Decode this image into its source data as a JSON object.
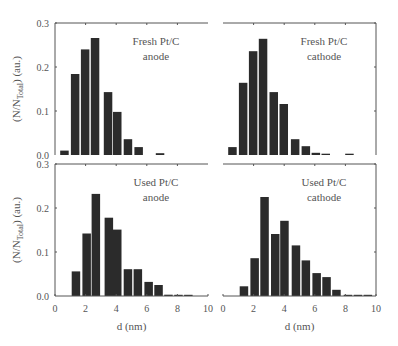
{
  "chart_data": [
    {
      "type": "bar",
      "title": "Fresh Pt/C anode",
      "title_lines": [
        "Fresh Pt/C",
        "anode"
      ],
      "xlabel": "d (nm)",
      "ylabel": "(N/N_Total) (au.)",
      "xlim": [
        0,
        10
      ],
      "ylim": [
        0,
        0.3
      ],
      "xticks": [
        0,
        2,
        4,
        6,
        8,
        10
      ],
      "yticks": [
        0.0,
        0.1,
        0.2,
        0.3
      ],
      "bin_width": 0.62,
      "x": [
        0.65,
        1.35,
        2.0,
        2.65,
        3.5,
        4.1,
        4.8,
        5.5,
        6.9
      ],
      "values": [
        0.01,
        0.184,
        0.24,
        0.266,
        0.143,
        0.098,
        0.036,
        0.018,
        0.004
      ]
    },
    {
      "type": "bar",
      "title": "Fresh Pt/C cathode",
      "title_lines": [
        "Fresh Pt/C",
        "cathode"
      ],
      "xlabel": "d (nm)",
      "ylabel": "(N/N_Total) (au.)",
      "xlim": [
        0,
        10
      ],
      "ylim": [
        0,
        0.3
      ],
      "xticks": [
        0,
        2,
        4,
        6,
        8,
        10
      ],
      "yticks": [
        0.0,
        0.1,
        0.2,
        0.3
      ],
      "bin_width": 0.62,
      "x": [
        0.65,
        1.35,
        2.0,
        2.65,
        3.35,
        4.0,
        4.75,
        5.45,
        6.1,
        6.75,
        8.3
      ],
      "values": [
        0.018,
        0.164,
        0.236,
        0.264,
        0.143,
        0.116,
        0.036,
        0.02,
        0.005,
        0.003,
        0.003
      ]
    },
    {
      "type": "bar",
      "title": "Used Pt/C anode",
      "title_lines": [
        "Used Pt/C",
        "anode"
      ],
      "xlabel": "d (nm)",
      "ylabel": "(N/N_Total) (au.)",
      "xlim": [
        0,
        10
      ],
      "ylim": [
        0,
        0.3
      ],
      "xticks": [
        0,
        2,
        4,
        6,
        8,
        10
      ],
      "yticks": [
        0.0,
        0.1,
        0.2,
        0.3
      ],
      "bin_width": 0.62,
      "x": [
        1.4,
        2.1,
        2.7,
        3.55,
        4.1,
        4.8,
        5.45,
        6.15,
        6.8,
        7.45,
        8.1,
        8.75
      ],
      "values": [
        0.056,
        0.142,
        0.232,
        0.178,
        0.151,
        0.061,
        0.061,
        0.032,
        0.025,
        0.003,
        0.002,
        0.002
      ]
    },
    {
      "type": "bar",
      "title": "Used Pt/C cathode",
      "title_lines": [
        "Used Pt/C",
        "cathode"
      ],
      "xlabel": "d (nm)",
      "ylabel": "(N/N_Total) (au.)",
      "xlim": [
        0,
        10
      ],
      "ylim": [
        0,
        0.3
      ],
      "xticks": [
        0,
        2,
        4,
        6,
        8,
        10
      ],
      "yticks": [
        0.0,
        0.1,
        0.2,
        0.3
      ],
      "bin_width": 0.62,
      "x": [
        1.4,
        2.1,
        2.75,
        3.45,
        4.05,
        4.8,
        5.45,
        6.15,
        6.8,
        7.45,
        8.2,
        8.85,
        9.5
      ],
      "values": [
        0.022,
        0.086,
        0.225,
        0.141,
        0.171,
        0.115,
        0.081,
        0.052,
        0.043,
        0.014,
        0.002,
        0.002,
        0.002
      ]
    }
  ],
  "figure": {
    "ylabel_main": "(N/N",
    "ylabel_sub": "Total",
    "ylabel_tail": ") (au.)",
    "xlabel": "d (nm)",
    "bar_color": "#2b2b2b",
    "axis_color": "#555555"
  }
}
